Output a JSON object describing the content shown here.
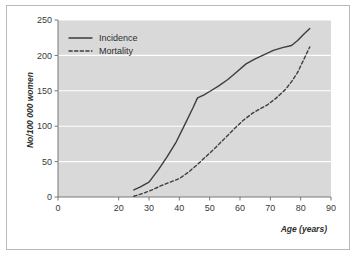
{
  "chart_data": {
    "type": "line",
    "title": "",
    "xlabel": "Age (years)",
    "ylabel": "No/100 000 women",
    "xlim": [
      0,
      90
    ],
    "ylim": [
      0,
      250
    ],
    "xticks": [
      0,
      20,
      30,
      40,
      50,
      60,
      70,
      80,
      90
    ],
    "yticks": [
      0,
      50,
      100,
      150,
      200,
      250
    ],
    "xtick_labels": [
      "0",
      "20",
      "30",
      "40",
      "50",
      "60",
      "70",
      "80",
      "90"
    ],
    "ytick_labels": [
      "0",
      "50",
      "100",
      "150",
      "200",
      "250"
    ],
    "grid": "horizontal",
    "legend_position": "top-left",
    "plot_background": "#d9d9d9",
    "gridline_color": "#ffffff",
    "line_color": "#3d3d3d",
    "series": [
      {
        "name": "Incidence",
        "style": "solid",
        "points": [
          [
            25,
            10
          ],
          [
            27,
            14
          ],
          [
            30,
            21
          ],
          [
            33,
            38
          ],
          [
            36,
            57
          ],
          [
            39,
            78
          ],
          [
            42,
            104
          ],
          [
            44.5,
            126
          ],
          [
            46,
            140
          ],
          [
            48,
            144
          ],
          [
            50,
            149
          ],
          [
            53,
            157
          ],
          [
            56,
            166
          ],
          [
            59,
            177
          ],
          [
            62,
            188
          ],
          [
            65,
            195
          ],
          [
            68,
            201
          ],
          [
            71,
            207
          ],
          [
            74,
            211
          ],
          [
            77,
            214
          ],
          [
            79,
            221
          ],
          [
            81,
            230
          ],
          [
            83,
            238
          ]
        ]
      },
      {
        "name": "Mortality",
        "style": "dashed",
        "points": [
          [
            25,
            1
          ],
          [
            28,
            5
          ],
          [
            31,
            10
          ],
          [
            34,
            16
          ],
          [
            37,
            21
          ],
          [
            40,
            26
          ],
          [
            43,
            35
          ],
          [
            46,
            46
          ],
          [
            49,
            58
          ],
          [
            52,
            70
          ],
          [
            55,
            83
          ],
          [
            58,
            96
          ],
          [
            61,
            108
          ],
          [
            64,
            118
          ],
          [
            66,
            123
          ],
          [
            69,
            130
          ],
          [
            72,
            140
          ],
          [
            75,
            152
          ],
          [
            77,
            163
          ],
          [
            79,
            176
          ],
          [
            81,
            194
          ],
          [
            83,
            212
          ]
        ]
      }
    ]
  },
  "legend": {
    "items": [
      {
        "label": "Incidence",
        "style": "solid"
      },
      {
        "label": "Mortality",
        "style": "dashed"
      }
    ]
  }
}
